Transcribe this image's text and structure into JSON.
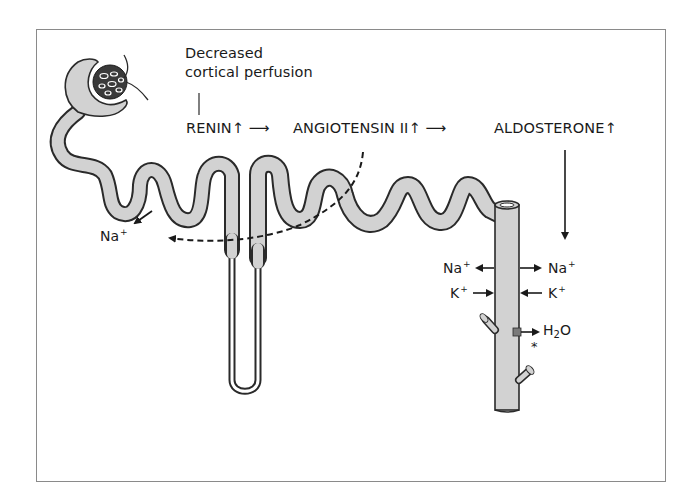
{
  "diagram": {
    "trigger_label": {
      "line1": "Decreased",
      "line2": "cortical perfusion"
    },
    "cascade": [
      {
        "label": "RENIN",
        "indicator": "↑"
      },
      {
        "label": "ANGIOTENSIN II",
        "indicator": "↑"
      },
      {
        "label": "ALDOSTERONE",
        "indicator": "↑"
      }
    ],
    "cascade_arrow": "⟶",
    "proximal_ion": {
      "symbol": "Na",
      "charge": "+"
    },
    "duct_ions": [
      {
        "symbol": "Na",
        "charge": "+",
        "left_direction": "out",
        "right_direction": "in"
      },
      {
        "symbol": "K",
        "charge": "+",
        "left_direction": "in",
        "right_direction": "out"
      }
    ],
    "water": {
      "symbol": "H",
      "subscript": "2",
      "rest": "O",
      "marker": "*"
    },
    "colors": {
      "tubule_fill": "#d2d2d2",
      "tubule_stroke": "#2a2a2a",
      "text": "#1a1a1a",
      "frame": "#8a8a8a",
      "channel": "#7a7a7a"
    }
  }
}
